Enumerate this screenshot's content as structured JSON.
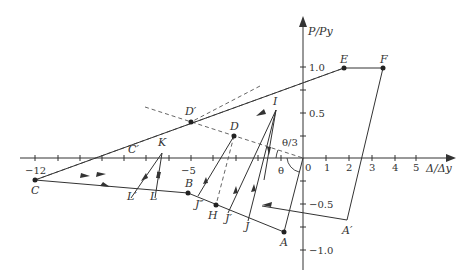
{
  "diagram": {
    "type": "hysteresis-load-displacement",
    "axes": {
      "x_label": "Δ/Δy",
      "y_label": "P/Py",
      "x_ticks": [
        "−12",
        "−5",
        "0",
        "1",
        "2",
        "3",
        "4",
        "5"
      ],
      "y_ticks": [
        "1.0",
        "0.5",
        "−0.5",
        "−1.0"
      ]
    },
    "points": {
      "A": "A",
      "A_prime": "A′",
      "B": "B",
      "C": "C",
      "C_prime": "C′",
      "D": "D",
      "D_prime": "D′",
      "E": "E",
      "F": "F",
      "H": "H",
      "I": "I",
      "J": "J",
      "J_prime": "J′",
      "J_doubleprime": "J″",
      "K": "K",
      "L": "L",
      "L_prime": "L′"
    },
    "angles": {
      "theta": "θ",
      "theta_third": "θ/3"
    },
    "colors": {
      "line": "#333333",
      "dashed": "#555555",
      "background": "#ffffff"
    }
  }
}
